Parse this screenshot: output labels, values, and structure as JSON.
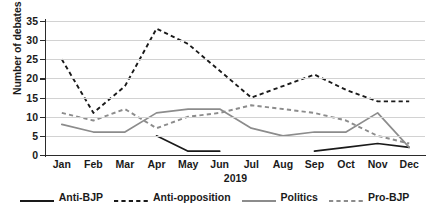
{
  "chart_data": {
    "type": "line",
    "title": "",
    "xlabel": "2019",
    "ylabel": "Number of debates per month",
    "categories": [
      "Jan",
      "Feb",
      "Mar",
      "Apr",
      "May",
      "Jun",
      "Jul",
      "Aug",
      "Sep",
      "Oct",
      "Nov",
      "Dec"
    ],
    "ylim": [
      0,
      35
    ],
    "yticks": [
      0,
      5,
      10,
      15,
      20,
      25,
      30,
      35
    ],
    "grid": "horizontal",
    "legend_position": "bottom",
    "series": [
      {
        "name": "Anti-BJP",
        "style": "solid",
        "color": "#1a1a1a",
        "values": [
          null,
          null,
          null,
          5,
          1,
          1,
          null,
          null,
          1,
          2,
          3,
          2
        ]
      },
      {
        "name": "Anti-opposition",
        "style": "dashed",
        "color": "#1a1a1a",
        "values": [
          25,
          11,
          18,
          33,
          29,
          22,
          15,
          18,
          21,
          17,
          14,
          14
        ]
      },
      {
        "name": "Politics",
        "style": "solid",
        "color": "#8c8c8c",
        "values": [
          8,
          6,
          6,
          11,
          12,
          12,
          7,
          5,
          6,
          6,
          11,
          2
        ]
      },
      {
        "name": "Pro-BJP",
        "style": "dashed",
        "color": "#8c8c8c",
        "values": [
          11,
          9,
          12,
          7,
          10,
          11,
          13,
          12,
          11,
          9,
          5,
          3
        ]
      }
    ]
  },
  "yaxis": {
    "title": "Number of debates per month",
    "ticks": [
      "0",
      "5",
      "10",
      "15",
      "20",
      "25",
      "30",
      "35"
    ]
  },
  "xaxis": {
    "title": "2019",
    "ticks": [
      "Jan",
      "Feb",
      "Mar",
      "Apr",
      "May",
      "Jun",
      "Jul",
      "Aug",
      "Sep",
      "Oct",
      "Nov",
      "Dec"
    ]
  },
  "legend": {
    "items": [
      {
        "label": "Anti-BJP",
        "style": "solid",
        "color": "#1a1a1a"
      },
      {
        "label": "Anti-opposition",
        "style": "dashed",
        "color": "#1a1a1a"
      },
      {
        "label": "Politics",
        "style": "solid",
        "color": "#8c8c8c"
      },
      {
        "label": "Pro-BJP",
        "style": "dashed",
        "color": "#8c8c8c"
      }
    ]
  }
}
